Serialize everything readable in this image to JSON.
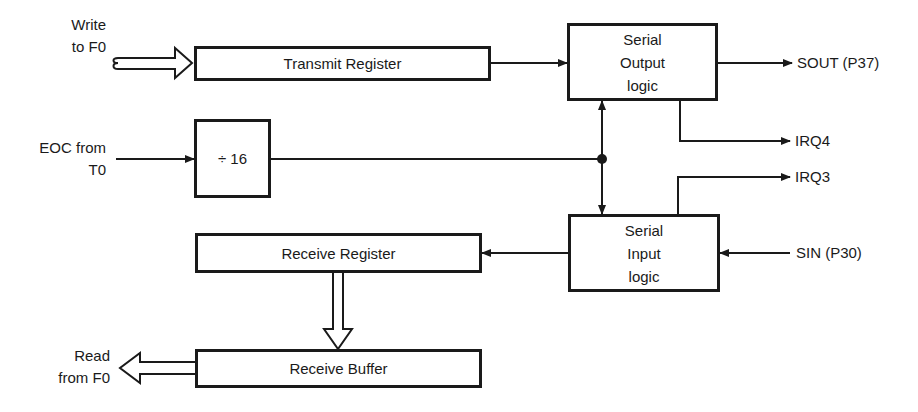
{
  "diagram": {
    "type": "block-diagram",
    "blocks": {
      "transmit_register": "Transmit Register",
      "divider": "÷ 16",
      "serial_output_logic": [
        "Serial",
        "Output",
        "logic"
      ],
      "serial_input_logic": [
        "Serial",
        "Input",
        "logic"
      ],
      "receive_register": "Receive Register",
      "receive_buffer": "Receive Buffer"
    },
    "inputs": {
      "write_to_f0": [
        "Write",
        "to F0"
      ],
      "eoc_from_t0": [
        "EOC from",
        "T0"
      ],
      "sin": "SIN (P30)"
    },
    "outputs": {
      "sout": "SOUT (P37)",
      "irq4": "IRQ4",
      "irq3": "IRQ3",
      "read_from_f0": [
        "Read",
        "from F0"
      ]
    },
    "colors": {
      "line": "#1a1a1a",
      "background": "#ffffff"
    }
  }
}
